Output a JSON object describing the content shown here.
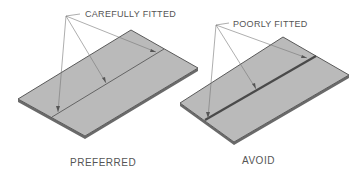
{
  "labels": {
    "left_callout": "CAREFULLY FITTED",
    "right_callout": "POORLY FITTED",
    "left_caption": "PREFERRED",
    "right_caption": "AVOID"
  },
  "colors": {
    "plate_fill": "#b9b9b9",
    "plate_edge": "#5a5a5a",
    "leader": "#777777",
    "text": "#555555"
  }
}
